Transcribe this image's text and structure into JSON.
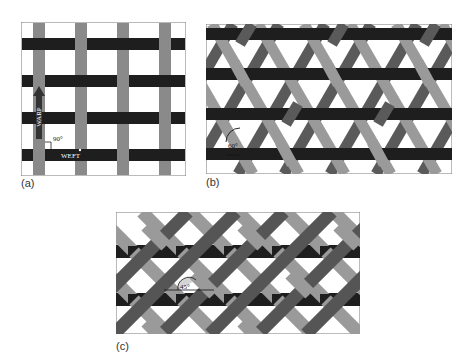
{
  "figure": {
    "panels": [
      {
        "id": "a",
        "label": "(a)",
        "type": "plain-weave",
        "annotations": {
          "warp": "WARP",
          "weft": "WEFT",
          "angle": "90°"
        }
      },
      {
        "id": "b",
        "label": "(b)",
        "type": "triaxial-weave",
        "annotations": {
          "angle": "60°"
        }
      },
      {
        "id": "c",
        "label": "(c)",
        "type": "bias-weave",
        "annotations": {
          "angle": "45°"
        }
      }
    ],
    "colors": {
      "weft": "#1e1e1e",
      "warp": "#8a8a8a",
      "bias_dark": "#555555",
      "bias_light": "#9a9a9a",
      "background": "#ffffff",
      "frame": "#777777"
    }
  }
}
